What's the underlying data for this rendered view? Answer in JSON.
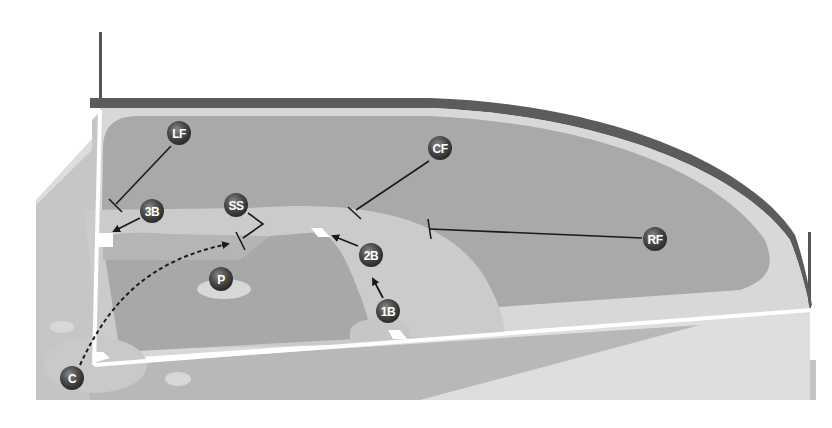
{
  "diagram": {
    "type": "baseball-field-positions",
    "colors": {
      "background": "#ffffff",
      "foul_territory": "#c4c4c4",
      "foul_light": "#dcdcdc",
      "outfield_grass": "#a9a9a9",
      "warning_track": "#d6d6d6",
      "outfield_wall": "#5c5c5c",
      "infield_dirt": "#c9c9c9",
      "infield_grass": "#a6a6a6",
      "foul_line": "#ffffff",
      "base": "#ffffff",
      "player_marker": "#4a4a4a",
      "arrow": "#1a1a1a"
    },
    "players": [
      {
        "id": "lf",
        "label": "LF",
        "name": "Left Fielder",
        "x": 179,
        "y": 133
      },
      {
        "id": "cf",
        "label": "CF",
        "name": "Center Fielder",
        "x": 440,
        "y": 148
      },
      {
        "id": "rf",
        "label": "RF",
        "name": "Right Fielder",
        "x": 655,
        "y": 239
      },
      {
        "id": "3b",
        "label": "3B",
        "name": "Third Baseman",
        "x": 152,
        "y": 211
      },
      {
        "id": "ss",
        "label": "SS",
        "name": "Shortstop",
        "x": 236,
        "y": 205
      },
      {
        "id": "2b",
        "label": "2B",
        "name": "Second Baseman",
        "x": 371,
        "y": 255
      },
      {
        "id": "1b",
        "label": "1B",
        "name": "First Baseman",
        "x": 388,
        "y": 311
      },
      {
        "id": "p",
        "label": "P",
        "name": "Pitcher",
        "x": 221,
        "y": 279
      },
      {
        "id": "c",
        "label": "C",
        "name": "Catcher",
        "x": 72,
        "y": 378
      }
    ],
    "bases": {
      "home": "home-plate",
      "first": "first-base",
      "second": "second-base",
      "third": "third-base"
    }
  }
}
